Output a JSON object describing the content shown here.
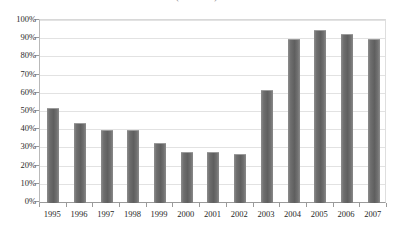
{
  "chart_data": {
    "type": "bar",
    "title": "(1995-2007)",
    "subtitle": "",
    "xlabel": "",
    "ylabel": "",
    "categories": [
      "1995",
      "1996",
      "1997",
      "1998",
      "1999",
      "2000",
      "2001",
      "2002",
      "2003",
      "2004",
      "2005",
      "2006",
      "2007"
    ],
    "values": [
      52,
      44,
      40,
      40,
      33,
      28,
      28,
      27,
      62,
      90,
      95,
      93,
      90
    ],
    "value_suffix": "%",
    "ylim": [
      0,
      100
    ],
    "ytick_labels": [
      "100%",
      "90%",
      "80%",
      "70%",
      "60%",
      "50%",
      "40%",
      "30%",
      "20%",
      "10%",
      "0%"
    ],
    "ytick_values": [
      100,
      90,
      80,
      70,
      60,
      50,
      40,
      30,
      20,
      10,
      0
    ],
    "grid": true,
    "legend": "none",
    "series": [
      {
        "name": "series-1",
        "color": "#6e6e6e",
        "values": [
          52,
          44,
          40,
          40,
          33,
          28,
          28,
          27,
          62,
          90,
          95,
          93,
          90
        ]
      }
    ]
  },
  "axis": {
    "y_label_color": "#2b2b2b",
    "x_label_color": "#1f1f1f",
    "gridline_color": "#e2e2e2",
    "axis_line_color": "#9a9a9a"
  }
}
